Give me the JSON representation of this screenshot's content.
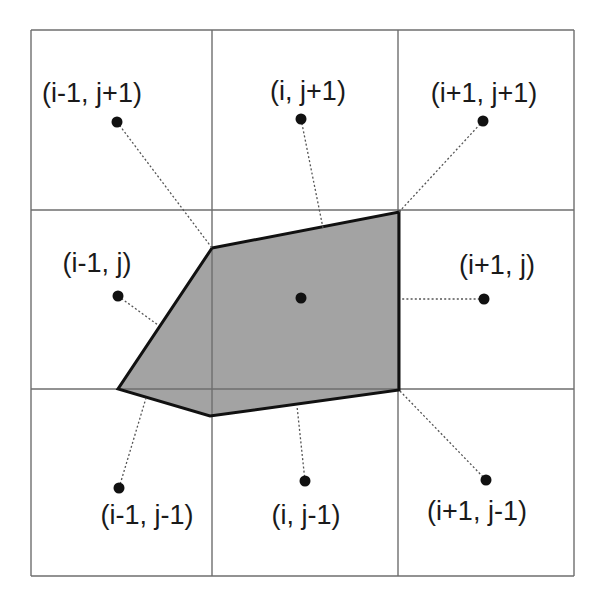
{
  "diagram": {
    "colors": {
      "background": "#ffffff",
      "grid_line": "#6e6e6e",
      "polygon_fill": "#a3a3a3",
      "polygon_stroke": "#111111",
      "dot": "#111111",
      "connector": "#555555",
      "text": "#1a1a1a"
    },
    "grid": {
      "x_lines": [
        31,
        212,
        398,
        574
      ],
      "y_lines": [
        30,
        210,
        389,
        576
      ]
    },
    "polygon": {
      "points": "212,248 399,212 399,390 210,416 118,389"
    },
    "cells": [
      {
        "id": "i-1_j+1",
        "label": "(i-1, j+1)",
        "label_x": 92,
        "label_y": 102,
        "dot": [
          117,
          122
        ],
        "connector_to": [
          212,
          248
        ]
      },
      {
        "id": "i_j+1",
        "label": "(i, j+1)",
        "label_x": 308,
        "label_y": 100,
        "dot": [
          301,
          119
        ],
        "connector_to": [
          323,
          228
        ]
      },
      {
        "id": "i+1_j+1",
        "label": "(i+1, j+1)",
        "label_x": 484,
        "label_y": 102,
        "dot": [
          483,
          121
        ],
        "connector_to": [
          399,
          212
        ]
      },
      {
        "id": "i-1_j",
        "label": "(i-1, j)",
        "label_x": 97,
        "label_y": 272,
        "dot": [
          118,
          296
        ],
        "connector_to": [
          158,
          325
        ]
      },
      {
        "id": "i_j",
        "label": "",
        "label_x": 0,
        "label_y": 0,
        "dot": [
          301,
          298
        ],
        "connector_to": null
      },
      {
        "id": "i+1_j",
        "label": "(i+1, j)",
        "label_x": 497,
        "label_y": 274,
        "dot": [
          484,
          299
        ],
        "connector_to": [
          400,
          299
        ]
      },
      {
        "id": "i-1_j-1",
        "label": "(i-1, j-1)",
        "label_x": 147,
        "label_y": 524,
        "dot": [
          119,
          488
        ],
        "connector_to": [
          146,
          398
        ]
      },
      {
        "id": "i_j-1",
        "label": "(i, j-1)",
        "label_x": 306,
        "label_y": 524,
        "dot": [
          305,
          481
        ],
        "connector_to": [
          297,
          406
        ]
      },
      {
        "id": "i+1_j-1",
        "label": "(i+1, j-1)",
        "label_x": 477,
        "label_y": 520,
        "dot": [
          486,
          480
        ],
        "connector_to": [
          399,
          390
        ]
      }
    ]
  }
}
